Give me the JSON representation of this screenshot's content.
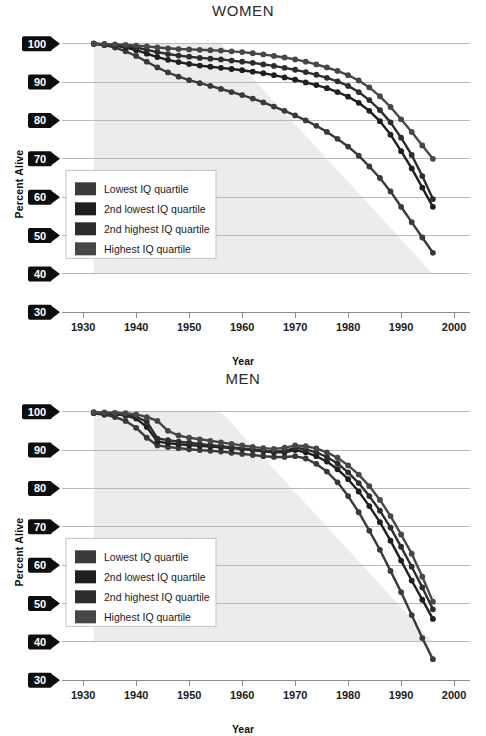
{
  "figure": {
    "panels": [
      "women",
      "men"
    ],
    "colors": {
      "grid": "#b9b9b9",
      "axis": "#8d8d8d",
      "tag_bg": "#0d0d0d",
      "tag_text": "#ffffff",
      "wedge": "#e6e6e6",
      "legend_border": "#c2c2c2",
      "background": "#ffffff"
    }
  },
  "chart_data": [
    {
      "type": "line",
      "title": "WOMEN",
      "xlabel": "Year",
      "ylabel": "Percent Alive",
      "xlim": [
        1926,
        2003
      ],
      "ylim": [
        28,
        102
      ],
      "xticks": [
        1930,
        1940,
        1950,
        1960,
        1970,
        1980,
        1990,
        2000
      ],
      "yticks": [
        30,
        40,
        50,
        60,
        70,
        80,
        90,
        100
      ],
      "grid": true,
      "legend_position": "lower-left",
      "x": [
        1932,
        1934,
        1936,
        1938,
        1940,
        1942,
        1944,
        1946,
        1948,
        1950,
        1952,
        1954,
        1956,
        1958,
        1960,
        1962,
        1964,
        1966,
        1968,
        1970,
        1972,
        1974,
        1976,
        1978,
        1980,
        1982,
        1984,
        1986,
        1988,
        1990,
        1992,
        1994,
        1996
      ],
      "series": [
        {
          "name": "Lowest IQ quartile",
          "color": "#3a3a3a",
          "values": [
            100,
            99.6,
            99.0,
            98.0,
            96.8,
            95.3,
            93.8,
            92.5,
            91.4,
            90.5,
            89.7,
            89.0,
            88.2,
            87.4,
            86.6,
            85.7,
            84.7,
            83.6,
            82.5,
            81.3,
            80.0,
            78.6,
            77.0,
            75.2,
            73.2,
            70.8,
            68.0,
            65.0,
            61.5,
            57.5,
            53.5,
            49.5,
            45.5
          ]
        },
        {
          "name": "2nd lowest IQ quartile",
          "color": "#1f1f1f",
          "values": [
            100,
            99.8,
            99.5,
            99.0,
            98.3,
            97.4,
            96.5,
            95.8,
            95.2,
            94.7,
            94.3,
            94.0,
            93.7,
            93.4,
            93.1,
            92.7,
            92.3,
            91.8,
            91.2,
            90.6,
            89.9,
            89.2,
            88.4,
            87.4,
            86.2,
            84.6,
            82.5,
            79.8,
            76.3,
            72.0,
            67.5,
            62.5,
            57.5
          ]
        },
        {
          "name": "2nd highest IQ quartile",
          "color": "#2d2d2d",
          "values": [
            100,
            99.9,
            99.7,
            99.4,
            99.0,
            98.4,
            97.8,
            97.3,
            96.9,
            96.6,
            96.3,
            96.1,
            95.9,
            95.6,
            95.3,
            95.0,
            94.6,
            94.2,
            93.7,
            93.2,
            92.6,
            91.9,
            91.1,
            90.2,
            89.0,
            87.4,
            85.3,
            82.7,
            79.5,
            75.5,
            71.0,
            65.5,
            59.5
          ]
        },
        {
          "name": "Highest IQ quartile",
          "color": "#474747",
          "values": [
            100,
            99.9,
            99.8,
            99.7,
            99.5,
            99.3,
            99.0,
            98.8,
            98.6,
            98.5,
            98.4,
            98.3,
            98.2,
            98.0,
            97.8,
            97.5,
            97.2,
            96.8,
            96.4,
            95.9,
            95.3,
            94.6,
            93.8,
            92.9,
            91.8,
            90.4,
            88.6,
            86.3,
            83.5,
            80.3,
            77.0,
            73.5,
            70.0
          ]
        }
      ]
    },
    {
      "type": "line",
      "title": "MEN",
      "xlabel": "Year",
      "ylabel": "Percent Alive",
      "xlim": [
        1926,
        2003
      ],
      "ylim": [
        28,
        102
      ],
      "xticks": [
        1930,
        1940,
        1950,
        1960,
        1970,
        1980,
        1990,
        2000
      ],
      "yticks": [
        30,
        40,
        50,
        60,
        70,
        80,
        90,
        100
      ],
      "grid": true,
      "legend_position": "lower-left",
      "x": [
        1932,
        1934,
        1936,
        1938,
        1940,
        1942,
        1944,
        1946,
        1948,
        1950,
        1952,
        1954,
        1956,
        1958,
        1960,
        1962,
        1964,
        1966,
        1968,
        1970,
        1972,
        1974,
        1976,
        1978,
        1980,
        1982,
        1984,
        1986,
        1988,
        1990,
        1992,
        1994,
        1996
      ],
      "series": [
        {
          "name": "Lowest IQ quartile",
          "color": "#3a3a3a",
          "values": [
            99.6,
            99.2,
            98.6,
            97.6,
            95.8,
            93.2,
            91.2,
            90.8,
            90.5,
            90.2,
            90.0,
            89.8,
            89.6,
            89.3,
            89.0,
            88.7,
            88.4,
            88.2,
            88.2,
            88.4,
            87.8,
            86.4,
            84.4,
            81.6,
            78.0,
            73.8,
            69.0,
            64.0,
            58.5,
            53.0,
            47.0,
            41.0,
            35.5
          ]
        },
        {
          "name": "2nd lowest IQ quartile",
          "color": "#1f1f1f",
          "values": [
            99.8,
            99.6,
            99.4,
            99.0,
            98.2,
            96.0,
            92.2,
            91.8,
            91.5,
            91.3,
            91.1,
            90.9,
            90.7,
            90.5,
            90.3,
            90.0,
            89.7,
            89.4,
            89.4,
            90.0,
            89.4,
            88.4,
            87.0,
            85.0,
            82.4,
            79.2,
            75.4,
            71.2,
            66.4,
            61.2,
            56.0,
            51.0,
            46.0
          ]
        },
        {
          "name": "2nd highest IQ quartile",
          "color": "#2d2d2d",
          "values": [
            99.7,
            99.5,
            99.3,
            99.1,
            98.6,
            97.4,
            93.0,
            92.6,
            92.2,
            91.9,
            91.6,
            91.3,
            91.0,
            90.7,
            90.4,
            90.1,
            89.8,
            89.6,
            89.8,
            90.6,
            90.2,
            89.4,
            88.2,
            86.5,
            84.2,
            81.4,
            78.0,
            74.2,
            69.8,
            64.8,
            59.6,
            54.2,
            48.5
          ]
        },
        {
          "name": "Highest IQ quartile",
          "color": "#474747",
          "values": [
            99.9,
            99.8,
            99.7,
            99.6,
            99.3,
            98.6,
            97.6,
            95.0,
            93.8,
            93.2,
            92.8,
            92.4,
            92.0,
            91.6,
            91.2,
            90.8,
            90.5,
            90.3,
            90.6,
            91.2,
            91.0,
            90.4,
            89.4,
            88.0,
            86.0,
            83.6,
            80.6,
            77.0,
            72.8,
            68.0,
            63.0,
            57.0,
            50.5
          ]
        }
      ]
    }
  ],
  "legend": {
    "items": [
      {
        "label": "Lowest IQ quartile",
        "color": "#3a3a3a"
      },
      {
        "label": "2nd lowest IQ quartile",
        "color": "#1f1f1f"
      },
      {
        "label": "2nd highest IQ quartile",
        "color": "#2d2d2d"
      },
      {
        "label": "Highest IQ quartile",
        "color": "#474747"
      }
    ]
  }
}
